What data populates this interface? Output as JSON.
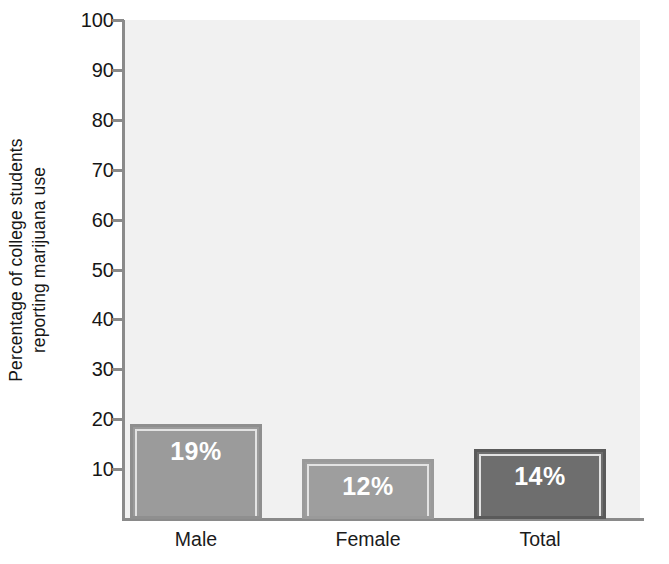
{
  "chart_data": {
    "type": "bar",
    "title": "",
    "subtitle": "",
    "xlabel": "",
    "ylabel": "Percentage of college students reporting marijuana use",
    "ylabel_lines": [
      "Percentage of college students",
      "reporting marijuana use"
    ],
    "categories": [
      "Male",
      "Female",
      "Total"
    ],
    "values": [
      19,
      12,
      14
    ],
    "value_labels": [
      "19%",
      "12%",
      "14%"
    ],
    "ylim": [
      0,
      100
    ],
    "ytick_values": [
      10,
      20,
      30,
      40,
      50,
      60,
      70,
      80,
      90,
      100
    ],
    "ytick_labels": [
      "10",
      "20",
      "30",
      "40",
      "50",
      "60",
      "70",
      "80",
      "90",
      "100"
    ],
    "ytick_step": 10,
    "grid": false,
    "legend": "none",
    "bar_colors": [
      "#9b9b9b",
      "#9e9e9e",
      "#6e6e6e"
    ],
    "bar_border_colors": [
      "#8f8f8f",
      "#9a9a9a",
      "#5a5a5a"
    ],
    "bar_label_color": "#ffffff",
    "plot_background": "#f1f1f1",
    "axis_color": "#8a8a8a",
    "text_color": "#161616"
  }
}
